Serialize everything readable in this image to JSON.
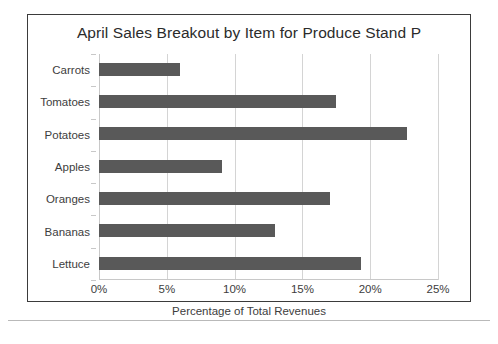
{
  "chart_data": {
    "type": "bar",
    "orientation": "horizontal",
    "title": "April Sales Breakout by Item for Produce Stand P",
    "xlabel": "Percentage of Total Revenues",
    "ylabel": "",
    "categories": [
      "Carrots",
      "Tomatoes",
      "Potatoes",
      "Apples",
      "Oranges",
      "Bananas",
      "Lettuce"
    ],
    "values": [
      6.0,
      17.5,
      22.7,
      9.1,
      17.0,
      13.0,
      19.3
    ],
    "xlim": [
      0,
      25
    ],
    "xticks": [
      0,
      5,
      10,
      15,
      20,
      25
    ],
    "xtick_labels": [
      "0%",
      "5%",
      "10%",
      "15%",
      "20%",
      "25%"
    ],
    "grid": "vertical",
    "legend": "none",
    "bar_color": "#595959",
    "gridline_color": "#d4d4d4",
    "frame_color": "#3b3b3b",
    "text_color": "#3d3d3d",
    "title_color": "#2b2b2b"
  }
}
